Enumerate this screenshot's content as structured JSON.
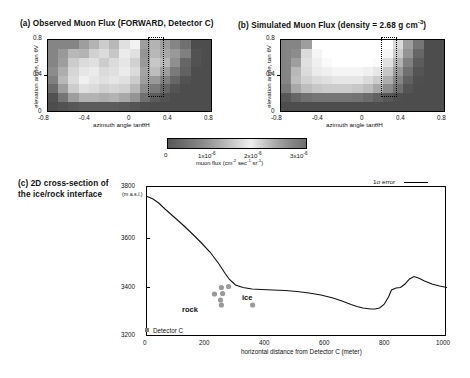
{
  "figure": {
    "panel_a": {
      "title": "(a) Observed Muon Flux (FORWARD, Detector C)",
      "xlabel": "azimuth angle tanθH",
      "ylabel": "elevation angle, tan θV",
      "xticks": [
        "-0.8",
        "-0.4",
        "0",
        "0.4",
        "0.8"
      ],
      "yticks": [
        "0",
        "0.4",
        "0.8"
      ],
      "xlim": [
        -0.8,
        0.8
      ],
      "ylim": [
        0,
        0.8
      ],
      "highlight_box": {
        "x0": 0.05,
        "x1": 0.2,
        "y0": 0.2,
        "y1": 0.82,
        "style": "dotted"
      }
    },
    "panel_b": {
      "title_main": "(b) Simulated Muon Flux (density = 2.68 g cm",
      "title_sup": "-3",
      "title_tail": ")",
      "xlabel": "azimuth angle tanθH",
      "ylabel": "elevation angle, tan θV",
      "xticks": [
        "-0.8",
        "-0.4",
        "0",
        "0.4",
        "0.8"
      ],
      "yticks": [
        "0",
        "0.4",
        "0.8"
      ],
      "xlim": [
        -0.8,
        0.8
      ],
      "ylim": [
        0,
        0.8
      ],
      "highlight_box": {
        "x0": 0.05,
        "x1": 0.2,
        "y0": 0.2,
        "y1": 0.82,
        "style": "dotted"
      }
    },
    "colorbar": {
      "ticks": [
        "0",
        "1x10",
        "2x10",
        "3x10"
      ],
      "tick_sups": [
        "",
        "-6",
        "-6",
        "-6"
      ],
      "unit_main": "muon flux (cm",
      "unit_sup1": "-2",
      "unit_mid": "sec",
      "unit_sup2": "-1",
      "unit_mid2": "sr",
      "unit_sup3": "-1",
      "unit_tail": ")",
      "range": [
        0,
        3e-06
      ]
    },
    "panel_c": {
      "title_line1": "(c) 2D cross-section of",
      "title_line2": "the ice/rock interface",
      "ylabel_top": "3800",
      "ylabel_unit": "(m a.s.l.)",
      "yticks": [
        "3200",
        "3400",
        "3600",
        "3800"
      ],
      "xticks": [
        "0",
        "200",
        "400",
        "600",
        "800",
        "1000"
      ],
      "xlabel": "horizontal distance from Detector C (meter)",
      "ylim": [
        3200,
        3800
      ],
      "xlim": [
        0,
        1000
      ],
      "legend_label": "1σ error",
      "annot_rock": "rock",
      "annot_ice": "ice",
      "annot_detector": "Detector C"
    }
  },
  "chart_data": [
    {
      "type": "heatmap",
      "title": "(a) Observed Muon Flux (FORWARD, Detector C)",
      "xlabel": "azimuth angle tanθH",
      "ylabel": "elevation angle, tan θV",
      "xlim": [
        -0.8,
        0.8
      ],
      "ylim": [
        0,
        0.8
      ],
      "ncols": 16,
      "nrows": 8,
      "colormap": "gray",
      "vmin": 0,
      "vmax": 3e-06,
      "values": [
        [
          0.52,
          0.52,
          0.52,
          0.62,
          0.7,
          0.8,
          0.72,
          0.88,
          0.95,
          0.62,
          0.7,
          0.62,
          0.52,
          0.44,
          0.3,
          0.3
        ],
        [
          0.52,
          0.6,
          0.72,
          0.7,
          0.82,
          0.86,
          0.78,
          0.92,
          0.88,
          0.58,
          0.72,
          0.66,
          0.6,
          0.5,
          0.32,
          0.3
        ],
        [
          0.52,
          0.62,
          0.8,
          0.86,
          0.88,
          0.8,
          0.86,
          0.9,
          0.82,
          0.6,
          0.78,
          0.72,
          0.56,
          0.4,
          0.32,
          0.3
        ],
        [
          0.55,
          0.68,
          0.84,
          0.9,
          0.92,
          0.86,
          0.88,
          0.92,
          0.86,
          0.64,
          0.74,
          0.62,
          0.48,
          0.38,
          0.3,
          0.3
        ],
        [
          0.5,
          0.72,
          0.86,
          0.94,
          0.9,
          0.88,
          0.9,
          0.88,
          0.8,
          0.62,
          0.6,
          0.5,
          0.4,
          0.32,
          0.3,
          0.3
        ],
        [
          0.42,
          0.62,
          0.8,
          0.88,
          0.86,
          0.82,
          0.84,
          0.82,
          0.72,
          0.55,
          0.48,
          0.4,
          0.33,
          0.3,
          0.3,
          0.3
        ],
        [
          0.32,
          0.46,
          0.62,
          0.7,
          0.7,
          0.68,
          0.7,
          0.66,
          0.58,
          0.44,
          0.36,
          0.32,
          0.3,
          0.3,
          0.3,
          0.3
        ],
        [
          0.3,
          0.32,
          0.34,
          0.36,
          0.36,
          0.36,
          0.36,
          0.35,
          0.33,
          0.31,
          0.3,
          0.3,
          0.3,
          0.3,
          0.3,
          0.3
        ]
      ]
    },
    {
      "type": "heatmap",
      "title": "(b) Simulated Muon Flux (density = 2.68 g cm-3)",
      "xlabel": "azimuth angle tanθH",
      "ylabel": "elevation angle, tan θV",
      "xlim": [
        -0.8,
        0.8
      ],
      "ylim": [
        0,
        0.8
      ],
      "ncols": 16,
      "nrows": 8,
      "colormap": "gray",
      "vmin": 0,
      "vmax": 3e-06,
      "values": [
        [
          0.52,
          0.52,
          0.62,
          1.0,
          1.0,
          1.0,
          1.0,
          1.0,
          1.0,
          1.0,
          1.0,
          0.86,
          0.62,
          0.46,
          0.3,
          0.3
        ],
        [
          0.52,
          0.55,
          0.86,
          0.96,
          1.0,
          1.0,
          1.0,
          1.0,
          1.0,
          1.0,
          0.96,
          0.8,
          0.58,
          0.4,
          0.3,
          0.3
        ],
        [
          0.52,
          0.62,
          0.88,
          0.94,
          0.98,
          1.0,
          1.0,
          1.0,
          1.0,
          0.98,
          0.88,
          0.7,
          0.5,
          0.36,
          0.3,
          0.3
        ],
        [
          0.52,
          0.72,
          0.86,
          0.92,
          0.94,
          0.96,
          0.96,
          0.96,
          0.94,
          0.9,
          0.78,
          0.6,
          0.44,
          0.33,
          0.3,
          0.3
        ],
        [
          0.52,
          0.74,
          0.82,
          0.86,
          0.88,
          0.9,
          0.9,
          0.9,
          0.86,
          0.8,
          0.68,
          0.52,
          0.38,
          0.31,
          0.3,
          0.3
        ],
        [
          0.48,
          0.66,
          0.74,
          0.78,
          0.8,
          0.8,
          0.8,
          0.78,
          0.74,
          0.66,
          0.55,
          0.44,
          0.33,
          0.3,
          0.3,
          0.3
        ],
        [
          0.34,
          0.4,
          0.44,
          0.46,
          0.46,
          0.46,
          0.46,
          0.45,
          0.42,
          0.38,
          0.34,
          0.31,
          0.3,
          0.3,
          0.3,
          0.3
        ],
        [
          0.3,
          0.3,
          0.3,
          0.3,
          0.3,
          0.3,
          0.3,
          0.3,
          0.3,
          0.3,
          0.3,
          0.3,
          0.3,
          0.3,
          0.3,
          0.3
        ]
      ]
    },
    {
      "type": "line",
      "title": "(c) 2D cross-section of the ice/rock interface",
      "xlabel": "horizontal distance from Detector C (meter)",
      "ylabel": "(m a.s.l.)",
      "xlim": [
        0,
        1000
      ],
      "ylim": [
        3200,
        3800
      ],
      "series": [
        {
          "name": "1σ error",
          "x": [
            0,
            20,
            40,
            60,
            90,
            120,
            150,
            180,
            210,
            240,
            260,
            275,
            295,
            320,
            350,
            380,
            420,
            460,
            500,
            540,
            580,
            620,
            650,
            680,
            700,
            720,
            745,
            760,
            775,
            790,
            805,
            815,
            830,
            845,
            860,
            875,
            890,
            905,
            925,
            950,
            975,
            1000
          ],
          "y": [
            3762,
            3752,
            3735,
            3712,
            3680,
            3648,
            3614,
            3578,
            3540,
            3492,
            3455,
            3430,
            3408,
            3398,
            3392,
            3390,
            3388,
            3386,
            3382,
            3376,
            3368,
            3356,
            3344,
            3330,
            3322,
            3316,
            3312,
            3312,
            3316,
            3330,
            3360,
            3388,
            3396,
            3398,
            3412,
            3432,
            3442,
            3436,
            3424,
            3412,
            3404,
            3398
          ]
        }
      ],
      "scatter_points": {
        "name": "measurement points",
        "x": [
          248,
          272,
          225,
          252,
          245,
          248,
          352
        ],
        "y": [
          3398,
          3402,
          3372,
          3374,
          3348,
          3328,
          3328
        ],
        "color": "#9a9a9a"
      },
      "annotations": [
        {
          "text": "rock",
          "x": 155,
          "y": 3345
        },
        {
          "text": "ice",
          "x": 330,
          "y": 3378
        },
        {
          "text": "Detector C",
          "x": 40,
          "y": 3210
        }
      ],
      "detector_marker": {
        "x": 0,
        "y": 3205,
        "color": "#808080"
      },
      "legend_position": "top-right",
      "grid": false
    }
  ]
}
